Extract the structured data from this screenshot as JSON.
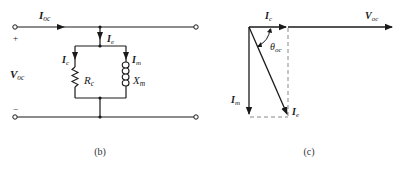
{
  "circuit": {
    "caption": "(b)",
    "labels": {
      "I_oc": {
        "main": "I",
        "sub": "oc"
      },
      "I_e": {
        "main": "I",
        "sub": "e"
      },
      "I_c": {
        "main": "I",
        "sub": "c"
      },
      "I_m": {
        "main": "I",
        "sub": "m"
      },
      "R_c": {
        "main": "R",
        "sub": "c"
      },
      "X_m": {
        "main": "X",
        "sub": "m"
      },
      "V_oc": {
        "main": "V",
        "sub": "oc"
      },
      "plus": "+",
      "minus": "−"
    }
  },
  "phasor": {
    "caption": "(c)",
    "labels": {
      "I_c": {
        "main": "I",
        "sub": "c"
      },
      "V_oc": {
        "main": "V",
        "sub": "oc"
      },
      "theta_oc": {
        "main": "θ",
        "sub": "oc"
      },
      "I_m": {
        "main": "I",
        "sub": "m"
      },
      "I_e": {
        "main": "I",
        "sub": "e"
      }
    }
  },
  "colors": {
    "line": "#1a1a1a",
    "dashed": "#888888"
  }
}
